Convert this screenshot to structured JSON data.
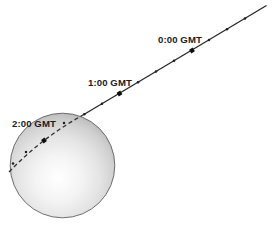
{
  "diagram": {
    "description_labels": {
      "t0": "0:00 GMT",
      "t1": "1:00 GMT",
      "t2": "2:00 GMT"
    },
    "hour_markers": [
      {
        "label": "0:00 GMT",
        "x": 192,
        "y": 50.5,
        "label_x": 158,
        "label_y": 43,
        "angle": -30.8
      },
      {
        "label": "1:00 GMT",
        "x": 119.5,
        "y": 93.5,
        "label_x": 88,
        "label_y": 86,
        "angle": -30.8
      },
      {
        "label": "2:00 GMT",
        "x": 44,
        "y": 140.5,
        "label_x": 12,
        "label_y": 127,
        "angle": -37.5
      }
    ],
    "minor_ticks": [
      [
        245,
        18.5
      ],
      [
        227,
        29.2
      ],
      [
        209,
        40.0
      ],
      [
        174,
        60.8
      ],
      [
        156,
        71.6
      ],
      [
        138,
        82.3
      ],
      [
        102,
        103.7
      ],
      [
        84.3,
        114.3
      ],
      [
        64,
        123
      ],
      [
        26,
        152
      ],
      [
        13,
        163.5
      ]
    ],
    "colors": {
      "background": "#ffffff",
      "trajectory": "#262626",
      "dashed": "#303030",
      "tick": "#1f1f1f",
      "hour": "#101010",
      "label": "#1b1b1b",
      "outline": "#4f4f4f",
      "sphere_highlight": "#ffffff",
      "sphere_edge": "#a0a0a0"
    }
  }
}
